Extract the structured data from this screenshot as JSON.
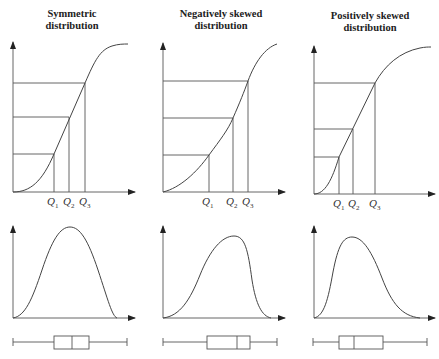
{
  "panels": [
    {
      "title_line1": "Symmetric",
      "title_line2": "distribution",
      "quartile_labels": [
        "Q1",
        "Q2",
        "Q3"
      ],
      "boxplot": {
        "min": 13,
        "q1": 54,
        "median": 72,
        "q3": 89,
        "max": 127
      }
    },
    {
      "title_line1": "Negatively skewed",
      "title_line2": "distribution",
      "quartile_labels": [
        "Q1",
        "Q2",
        "Q3"
      ],
      "boxplot": {
        "min": 163,
        "q1": 207,
        "median": 237,
        "q3": 250,
        "max": 277
      }
    },
    {
      "title_line1": "Positively skewed",
      "title_line2": "distribution",
      "quartile_labels": [
        "Q1",
        "Q2",
        "Q3"
      ],
      "boxplot": {
        "min": 313,
        "q1": 339,
        "median": 354,
        "q3": 383,
        "max": 427
      }
    }
  ],
  "q": {
    "letter": "Q",
    "s1": "1",
    "s2": "2",
    "s3": "3"
  },
  "colors": {
    "line": "#555555",
    "text": "#222222",
    "background": "#ffffff"
  }
}
